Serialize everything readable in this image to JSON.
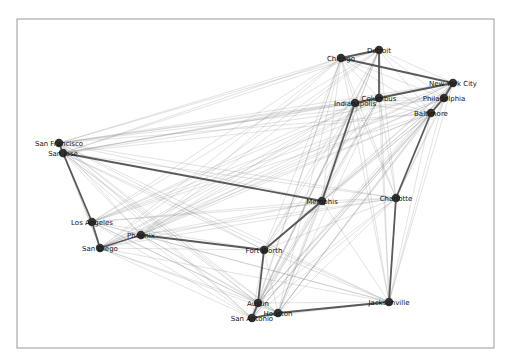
{
  "figure": {
    "type": "network-graph",
    "frame": {
      "x": 17,
      "y": 19,
      "width": 477,
      "height": 329
    },
    "colors": {
      "node": "#333333",
      "edge": "#7a7a7a",
      "tour_edge": "#4a4a4a",
      "frame": "#9a9a9a"
    }
  },
  "nodes": [
    {
      "id": "San Francisco",
      "x": 59,
      "y": 143
    },
    {
      "id": "San Jose",
      "x": 63,
      "y": 153
    },
    {
      "id": "Los Angeles",
      "x": 92,
      "y": 222
    },
    {
      "id": "San Diego",
      "x": 100,
      "y": 248
    },
    {
      "id": "Phoenix",
      "x": 141,
      "y": 235
    },
    {
      "id": "Fort Worth",
      "x": 264,
      "y": 250
    },
    {
      "id": "Austin",
      "x": 258,
      "y": 303
    },
    {
      "id": "San Antonio",
      "x": 252,
      "y": 318
    },
    {
      "id": "Houston",
      "x": 278,
      "y": 313
    },
    {
      "id": "Jacksonville",
      "x": 389,
      "y": 302
    },
    {
      "id": "Charlotte",
      "x": 396,
      "y": 198
    },
    {
      "id": "Memphis",
      "x": 322,
      "y": 201
    },
    {
      "id": "Indianapolis",
      "x": 355,
      "y": 103
    },
    {
      "id": "Columbus",
      "x": 379,
      "y": 98
    },
    {
      "id": "Chicago",
      "x": 341,
      "y": 58
    },
    {
      "id": "Detroit",
      "x": 379,
      "y": 50
    },
    {
      "id": "New York City",
      "x": 453,
      "y": 83
    },
    {
      "id": "Philadelphia",
      "x": 444,
      "y": 98
    },
    {
      "id": "Baltimore",
      "x": 431,
      "y": 113
    }
  ],
  "tour_edges": [
    [
      "San Francisco",
      "San Jose"
    ],
    [
      "San Jose",
      "Los Angeles"
    ],
    [
      "Los Angeles",
      "San Diego"
    ],
    [
      "San Diego",
      "Phoenix"
    ],
    [
      "Phoenix",
      "Fort Worth"
    ],
    [
      "Fort Worth",
      "Austin"
    ],
    [
      "Austin",
      "San Antonio"
    ],
    [
      "San Antonio",
      "Houston"
    ],
    [
      "Houston",
      "Jacksonville"
    ],
    [
      "Jacksonville",
      "Charlotte"
    ],
    [
      "Charlotte",
      "Baltimore"
    ],
    [
      "Baltimore",
      "Philadelphia"
    ],
    [
      "Philadelphia",
      "New York City"
    ],
    [
      "New York City",
      "Chicago"
    ],
    [
      "Chicago",
      "Detroit"
    ],
    [
      "Detroit",
      "Columbus"
    ],
    [
      "Columbus",
      "Indianapolis"
    ],
    [
      "Indianapolis",
      "Memphis"
    ],
    [
      "Memphis",
      "San Jose"
    ],
    [
      "Memphis",
      "Fort Worth"
    ],
    [
      "New York City",
      "Columbus"
    ]
  ],
  "complete_graph": true
}
